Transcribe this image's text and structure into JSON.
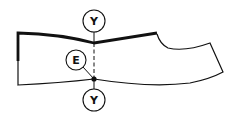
{
  "diagram": {
    "type": "sewing-pattern-piece",
    "colors": {
      "stroke": "#111111",
      "background": "#ffffff"
    },
    "markers": [
      {
        "id": "top",
        "label": "Y"
      },
      {
        "id": "middle",
        "label": "E"
      },
      {
        "id": "bottom",
        "label": "Y"
      }
    ]
  }
}
